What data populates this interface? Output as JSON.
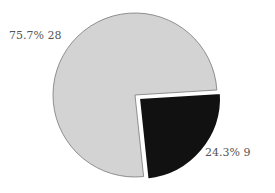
{
  "chart_data": {
    "type": "pie",
    "title": "",
    "slices": [
      {
        "label": "75.7%  28",
        "percent": 75.7,
        "value": 28,
        "color": "#d3d3d3"
      },
      {
        "label": "24.3%  9",
        "percent": 24.3,
        "value": 9,
        "color": "#111111",
        "exploded": true
      }
    ],
    "legend": "none"
  },
  "labels": {
    "large": "75.7%  28",
    "small": "24.3%  9"
  }
}
